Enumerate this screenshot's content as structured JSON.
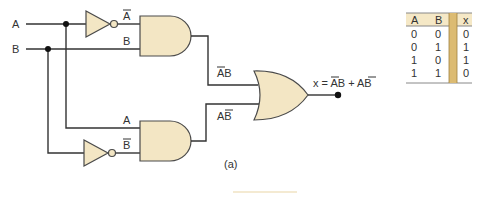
{
  "colors": {
    "gate_fill": "#f3e6c4",
    "wire": "#333333",
    "table_header": "#f5e8c6",
    "table_divider": "#d9b56a"
  },
  "inputs": {
    "a": "A",
    "b": "B"
  },
  "signals": {
    "not_a": "A",
    "b_top": "B",
    "a_bottom": "A",
    "not_b": "B",
    "term1": "AB",
    "term2": "AB"
  },
  "output": {
    "expression": "x = AB + AB"
  },
  "caption": "(a)",
  "truth_table": {
    "headers": [
      "A",
      "B",
      "x"
    ],
    "rows": [
      [
        "0",
        "0",
        "0"
      ],
      [
        "0",
        "1",
        "1"
      ],
      [
        "1",
        "0",
        "1"
      ],
      [
        "1",
        "1",
        "0"
      ]
    ]
  }
}
